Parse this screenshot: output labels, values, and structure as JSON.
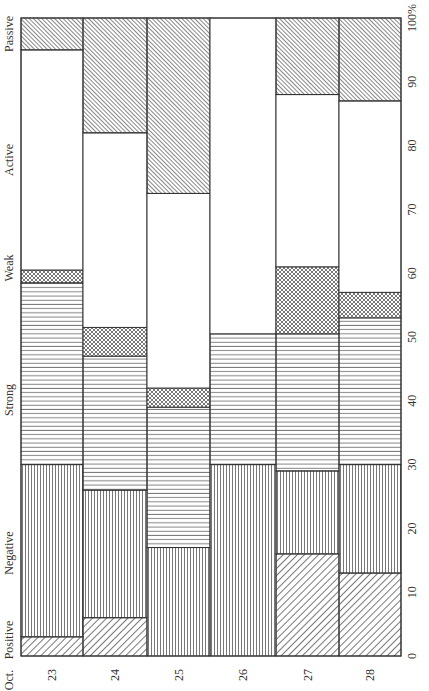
{
  "chart_data": {
    "type": "bar",
    "stacked": true,
    "orientation": "rotated-90",
    "title": "",
    "xlabel": "Oct.",
    "ylabel": "",
    "categories": [
      "23",
      "24",
      "25",
      "26",
      "27",
      "28"
    ],
    "ylim": [
      0,
      100
    ],
    "yticks": [
      "0",
      "10",
      "20",
      "30",
      "40",
      "50",
      "60",
      "70",
      "80",
      "90",
      "100%"
    ],
    "grid": false,
    "legend_position": "inline-axis-labels",
    "series": [
      {
        "name": "Positive",
        "pattern": "diag-back",
        "values": [
          3,
          6,
          0,
          0,
          16,
          13
        ]
      },
      {
        "name": "Negative",
        "pattern": "vertical",
        "values": [
          27,
          20,
          17,
          30,
          13,
          17
        ]
      },
      {
        "name": "Strong",
        "pattern": "horizontal",
        "values": [
          28.5,
          21,
          22,
          20.5,
          21.5,
          23
        ]
      },
      {
        "name": "Weak",
        "pattern": "crosshatch",
        "values": [
          2,
          4.5,
          3,
          0,
          10.5,
          4
        ]
      },
      {
        "name": "Active",
        "pattern": "blank",
        "values": [
          34.5,
          30.5,
          30.5,
          49.5,
          27,
          30
        ]
      },
      {
        "name": "Passive",
        "pattern": "diag-fwd",
        "values": [
          5,
          18,
          27.5,
          0,
          12,
          13
        ]
      }
    ],
    "axis_labels": {
      "category_axis_title": "Oct.",
      "segment_labels": [
        {
          "text": "Positive",
          "y": 640
        },
        {
          "text": "Negative",
          "y": 553
        },
        {
          "text": "Strong",
          "y": 400
        },
        {
          "text": "Weak",
          "y": 268
        },
        {
          "text": "Active",
          "y": 160
        },
        {
          "text": "Passive",
          "y": 34
        }
      ]
    }
  }
}
